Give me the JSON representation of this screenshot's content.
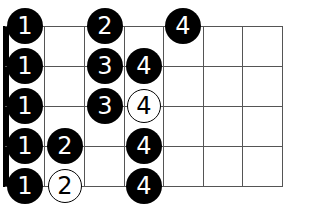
{
  "diagram": {
    "type": "fretboard-fingering",
    "strings": 5,
    "frets": 7,
    "colors": {
      "line": "#555555",
      "filled_dot": "#000000",
      "open_dot_fill": "#ffffff",
      "text_on_filled": "#ffffff"
    },
    "rows": [
      {
        "notes": [
          {
            "finger": "1",
            "fret": 1,
            "style": "filled"
          },
          {
            "finger": "2",
            "fret": 3,
            "style": "filled"
          },
          {
            "finger": "4",
            "fret": 5,
            "style": "filled"
          }
        ]
      },
      {
        "notes": [
          {
            "finger": "1",
            "fret": 1,
            "style": "filled"
          },
          {
            "finger": "3",
            "fret": 3,
            "style": "filled"
          },
          {
            "finger": "4",
            "fret": 4,
            "style": "filled"
          }
        ]
      },
      {
        "notes": [
          {
            "finger": "1",
            "fret": 1,
            "style": "filled"
          },
          {
            "finger": "3",
            "fret": 3,
            "style": "filled"
          },
          {
            "finger": "4",
            "fret": 4,
            "style": "open"
          }
        ]
      },
      {
        "notes": [
          {
            "finger": "1",
            "fret": 1,
            "style": "filled"
          },
          {
            "finger": "2",
            "fret": 2,
            "style": "filled"
          },
          {
            "finger": "4",
            "fret": 4,
            "style": "filled"
          }
        ]
      },
      {
        "notes": [
          {
            "finger": "1",
            "fret": 1,
            "style": "filled"
          },
          {
            "finger": "2",
            "fret": 2,
            "style": "open"
          },
          {
            "finger": "4",
            "fret": 4,
            "style": "filled"
          }
        ]
      }
    ]
  }
}
